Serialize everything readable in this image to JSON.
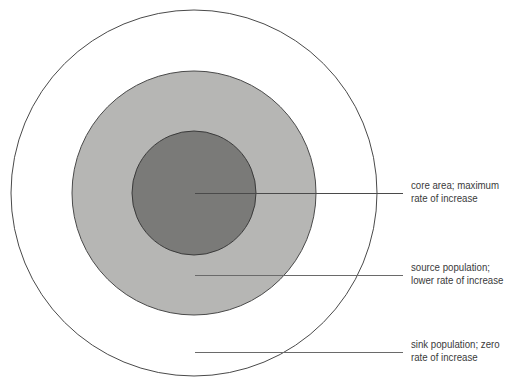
{
  "diagram": {
    "type": "concentric-zones",
    "colors": {
      "background": "#ffffff",
      "outer_fill": "#ffffff",
      "middle_fill": "#b6b6b4",
      "inner_fill": "#7a7a78",
      "stroke": "#4a4a4a",
      "leader": "#5a5a5a"
    },
    "zones": [
      {
        "id": "core",
        "line1": "core area; maximum",
        "line2": "rate of increase"
      },
      {
        "id": "source",
        "line1": "source population;",
        "line2": "lower rate of increase"
      },
      {
        "id": "sink",
        "line1": "sink population; zero",
        "line2": "rate of increase"
      }
    ]
  }
}
